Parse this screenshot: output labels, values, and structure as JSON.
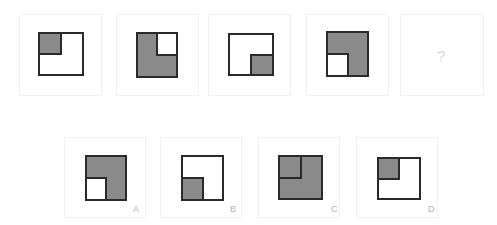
{
  "colors": {
    "shade": "#8a8a8a",
    "outline": "#2a2a2a",
    "background": "#ffffff",
    "panel_border": "#f1f1f1",
    "label": "#b0b0b0",
    "question_mark": "#d8d8d8"
  },
  "sequence": [
    {
      "index": 1,
      "fill": "shaded",
      "quadrant": "top-left",
      "description": "white square, top-left quarter shaded"
    },
    {
      "index": 2,
      "fill": "shaded",
      "quadrant": "top-right",
      "description": "shaded square, top-right quarter white"
    },
    {
      "index": 3,
      "fill": "shaded",
      "quadrant": "bottom-right",
      "description": "white square, bottom-right quarter shaded"
    },
    {
      "index": 4,
      "fill": "shaded",
      "quadrant": "bottom-left",
      "description": "shaded square, bottom-left quarter white"
    },
    {
      "index": 5,
      "placeholder": "?"
    }
  ],
  "options": [
    {
      "label": "A",
      "description": "shaded square, bottom-left quarter white"
    },
    {
      "label": "B",
      "description": "white square, bottom-left quarter shaded"
    },
    {
      "label": "C",
      "description": "fully shaded square, top-left quarter outlined"
    },
    {
      "label": "D",
      "description": "white square, top-left quarter shaded"
    }
  ]
}
